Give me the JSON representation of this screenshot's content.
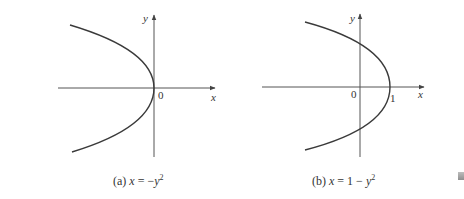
{
  "panels": [
    {
      "id": "a",
      "caption_prefix": "(a) ",
      "caption_lhs": "x",
      "caption_eq": " = −",
      "caption_var": "y",
      "caption_exp": "2",
      "caption_full": "(a) x = −y²",
      "equation": "x = -y^2",
      "axis_x_label": "x",
      "axis_y_label": "y",
      "origin_label": "0",
      "vertex": [
        0,
        0
      ]
    },
    {
      "id": "b",
      "caption_prefix": "(b) ",
      "caption_lhs": "x",
      "caption_eq": " = 1 − ",
      "caption_var": "y",
      "caption_exp": "2",
      "caption_full": "(b) x = 1 − y²",
      "equation": "x = 1 - y^2",
      "axis_x_label": "x",
      "axis_y_label": "y",
      "origin_label": "0",
      "vertex_label": "1",
      "vertex": [
        1,
        0
      ]
    }
  ],
  "colors": {
    "curve": "#3a3a3a",
    "axis": "#555555",
    "text": "#333333",
    "background": "#ffffff"
  }
}
